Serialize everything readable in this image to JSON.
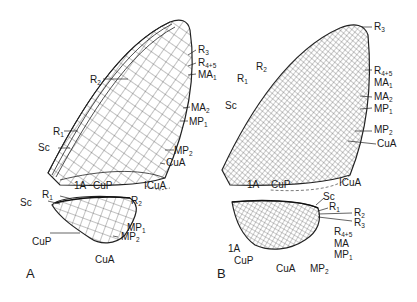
{
  "figure": {
    "panels": [
      {
        "id": "A",
        "label": "A",
        "forewing_labels": [
          {
            "base": "R",
            "sub": "3"
          },
          {
            "base": "R",
            "sub": "4+5"
          },
          {
            "base": "MA",
            "sub": "1"
          },
          {
            "base": "R",
            "sub": "2"
          },
          {
            "base": "MA",
            "sub": "2"
          },
          {
            "base": "MP",
            "sub": "1"
          },
          {
            "base": "R",
            "sub": "1"
          },
          {
            "base": "Sc",
            "sub": ""
          },
          {
            "base": "MP",
            "sub": "2"
          },
          {
            "base": "CuA",
            "sub": ""
          },
          {
            "base": "1A",
            "sub": ""
          },
          {
            "base": "CuP",
            "sub": ""
          },
          {
            "base": "ICuA",
            "sub": ""
          }
        ],
        "hindwing_labels": [
          {
            "base": "R",
            "sub": "1"
          },
          {
            "base": "Sc",
            "sub": ""
          },
          {
            "base": "R",
            "sub": "2"
          },
          {
            "base": "MP",
            "sub": "1"
          },
          {
            "base": "CuP",
            "sub": ""
          },
          {
            "base": "MP",
            "sub": "2"
          },
          {
            "base": "CuA",
            "sub": ""
          }
        ]
      },
      {
        "id": "B",
        "label": "B",
        "forewing_labels": [
          {
            "base": "R",
            "sub": "3"
          },
          {
            "base": "R",
            "sub": "2"
          },
          {
            "base": "R",
            "sub": "1"
          },
          {
            "base": "R",
            "sub": "4+5"
          },
          {
            "base": "MA",
            "sub": "1"
          },
          {
            "base": "Sc",
            "sub": ""
          },
          {
            "base": "MA",
            "sub": "2"
          },
          {
            "base": "MP",
            "sub": "1"
          },
          {
            "base": "MP",
            "sub": "2"
          },
          {
            "base": "CuA",
            "sub": ""
          },
          {
            "base": "1A",
            "sub": ""
          },
          {
            "base": "CuP",
            "sub": ""
          },
          {
            "base": "ICuA",
            "sub": ""
          }
        ],
        "hindwing_labels": [
          {
            "base": "Sc",
            "sub": ""
          },
          {
            "base": "R",
            "sub": "1"
          },
          {
            "base": "R",
            "sub": "2"
          },
          {
            "base": "R",
            "sub": "3"
          },
          {
            "base": "R",
            "sub": "4+5"
          },
          {
            "base": "MA",
            "sub": ""
          },
          {
            "base": "1A",
            "sub": ""
          },
          {
            "base": "MP",
            "sub": "1"
          },
          {
            "base": "CuP",
            "sub": ""
          },
          {
            "base": "CuA",
            "sub": ""
          },
          {
            "base": "MP",
            "sub": "2"
          }
        ]
      }
    ]
  }
}
